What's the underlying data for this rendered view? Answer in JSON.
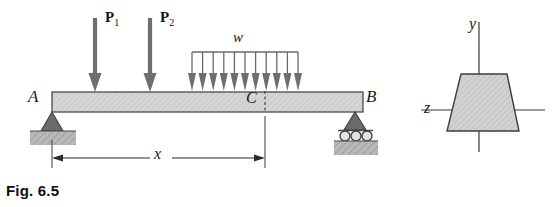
{
  "figure": {
    "caption": "Fig. 6.5",
    "type": "engineering-beam-diagram"
  },
  "beam": {
    "label_left_support": "A",
    "label_right_support": "B",
    "label_section": "C",
    "geometry": {
      "left_x": 52,
      "right_x": 363,
      "top_y": 92,
      "bottom_y": 112,
      "section_x": 265
    },
    "fill_color": "#d4d4d4",
    "edge_color": "#4a4a4a"
  },
  "loads": {
    "point_loads": [
      {
        "label": "P",
        "subscript": "1",
        "x": 95,
        "arrow_top": 18,
        "arrow_bottom": 92
      },
      {
        "label": "P",
        "subscript": "2",
        "x": 150,
        "arrow_top": 18,
        "arrow_bottom": 92
      }
    ],
    "distributed_load": {
      "label": "w",
      "start_x": 192,
      "end_x": 298,
      "bar_y": 52,
      "arrow_bottom": 90,
      "arrow_count": 11
    }
  },
  "dimension": {
    "label": "x",
    "from_x": 52,
    "to_x": 265,
    "line_y": 158,
    "description": "distance from A to section C"
  },
  "supports": {
    "pin": {
      "at": "A",
      "x": 52,
      "type": "pin-support"
    },
    "roller": {
      "at": "B",
      "x": 355,
      "type": "roller-support",
      "roller_count": 3
    }
  },
  "cross_section": {
    "shape": "trapezoid",
    "axis_vertical_label": "y",
    "axis_horizontal_label": "z",
    "origin_x": 479,
    "origin_y": 110,
    "top_left_x": 461,
    "top_right_x": 507,
    "bottom_left_x": 447,
    "bottom_right_x": 519,
    "top_y": 74,
    "bottom_y": 131,
    "fill_color": "#d0d0d0",
    "edge_color": "#3d3d3d"
  },
  "colors": {
    "arrow": "#6e6e6e",
    "ground_hatch": "#9a9a9a",
    "support_dark": "#5a5a5a",
    "line": "#2b2b2b"
  }
}
